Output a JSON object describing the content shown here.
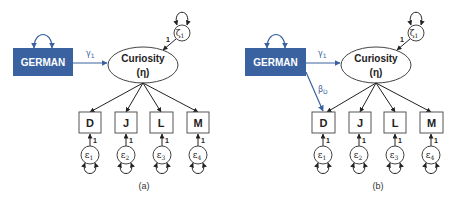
{
  "colors": {
    "exogenous_fill": "#3a62a0",
    "path_blue": "#3a62a0",
    "line": "#222222"
  },
  "panels": [
    {
      "caption": "(a)",
      "exogenous": {
        "label": "GERMAN"
      },
      "latent": {
        "label": "Curiosity",
        "symbol": "(η)"
      },
      "disturbance": {
        "symbol": "ζ",
        "subscript": "1",
        "loading": "1"
      },
      "paths": {
        "gamma": {
          "symbol": "γ",
          "subscript": "1"
        }
      },
      "indicators": [
        {
          "label": "D",
          "error": "ε",
          "error_sub": "1",
          "loading": "1"
        },
        {
          "label": "J",
          "error": "ε",
          "error_sub": "2",
          "loading": "1"
        },
        {
          "label": "L",
          "error": "ε",
          "error_sub": "3",
          "loading": "1"
        },
        {
          "label": "M",
          "error": "ε",
          "error_sub": "4",
          "loading": "1"
        }
      ]
    },
    {
      "caption": "(b)",
      "exogenous": {
        "label": "GERMAN"
      },
      "latent": {
        "label": "Curiosity",
        "symbol": "(η)"
      },
      "disturbance": {
        "symbol": "ζ",
        "subscript": "1",
        "loading": "1"
      },
      "paths": {
        "gamma": {
          "symbol": "γ",
          "subscript": "1"
        },
        "beta": {
          "symbol": "β",
          "subscript": "D"
        }
      },
      "indicators": [
        {
          "label": "D",
          "error": "ε",
          "error_sub": "1",
          "loading": "1"
        },
        {
          "label": "J",
          "error": "ε",
          "error_sub": "2",
          "loading": "1"
        },
        {
          "label": "L",
          "error": "ε",
          "error_sub": "3",
          "loading": "1"
        },
        {
          "label": "M",
          "error": "ε",
          "error_sub": "4",
          "loading": "1"
        }
      ]
    }
  ]
}
